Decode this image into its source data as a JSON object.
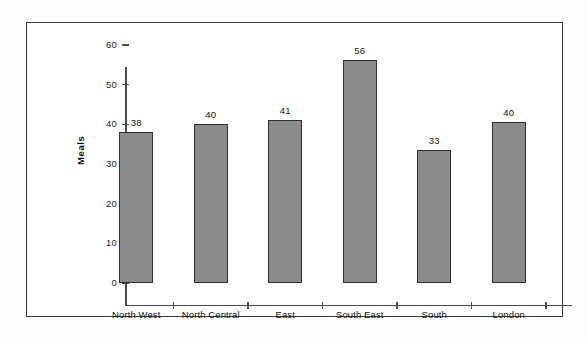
{
  "chart_data": {
    "type": "bar",
    "title": "",
    "subtitle": "",
    "xlabel": "",
    "ylabel": "Meals",
    "categories": [
      "North West",
      "North Central",
      "East",
      "South East",
      "South",
      "London"
    ],
    "values": [
      38,
      40.2,
      41.2,
      56.2,
      33.5,
      40.5
    ],
    "data_labels": [
      "38",
      "40",
      "41",
      "56",
      "33",
      "40"
    ],
    "ylim": [
      0,
      60
    ],
    "ytick_values": [
      0,
      10,
      20,
      30,
      40,
      50,
      60
    ],
    "ytick_labels": [
      "0",
      "10",
      "20",
      "30",
      "40",
      "50",
      "60"
    ],
    "grid": false,
    "legend": false,
    "legend_position": "none",
    "series": [
      {
        "name": "Meals",
        "values": [
          38,
          40.2,
          41.2,
          56.2,
          33.5,
          40.5
        ]
      }
    ],
    "colors": {
      "bar_fill": "#8b8b8b",
      "bar_border": "#2e2e2e",
      "axis": "#4a4a4a",
      "text": "#151515",
      "frame_border": "#3a3a3a",
      "background": "#ffffff"
    }
  }
}
